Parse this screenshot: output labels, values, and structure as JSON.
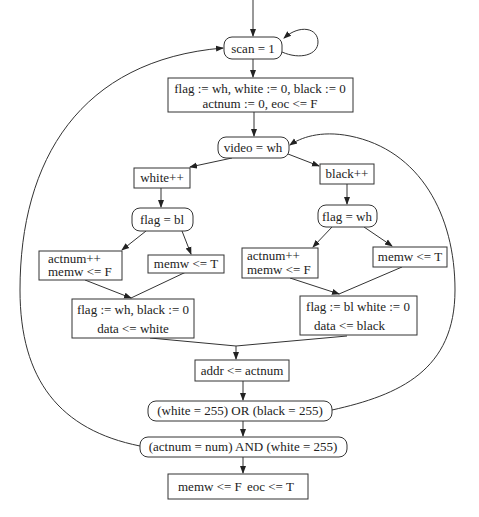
{
  "diagram": {
    "type": "flowchart",
    "nodes": {
      "scan": {
        "label": "scan = 1",
        "shape": "rounded"
      },
      "init": {
        "line1": "flag := wh, white := 0, black := 0",
        "line2": "actnum := 0, eoc <= F",
        "shape": "rect"
      },
      "video": {
        "label": "video = wh",
        "shape": "rounded"
      },
      "white_inc": {
        "label": "white++",
        "shape": "rect"
      },
      "black_inc": {
        "label": "black++",
        "shape": "rect"
      },
      "flag_bl": {
        "label": "flag = bl",
        "shape": "rounded"
      },
      "flag_wh": {
        "label": "flag = wh",
        "shape": "rounded"
      },
      "left_actnum": {
        "line1": "actnum++",
        "line2": "memw <= F",
        "shape": "rect"
      },
      "left_memw": {
        "label": "memw <= T",
        "shape": "rect"
      },
      "right_actnum": {
        "line1": "actnum++",
        "line2": "memw <= F",
        "shape": "rect"
      },
      "right_memw": {
        "label": "memw <= T",
        "shape": "rect"
      },
      "left_assign": {
        "line1": "flag := wh, black := 0",
        "line2": "data <= white",
        "shape": "rect"
      },
      "right_assign": {
        "line1": "flag := bl white := 0",
        "line2": "data <= black",
        "shape": "rect"
      },
      "addr": {
        "label": "addr <= actnum",
        "shape": "rect"
      },
      "or_cond": {
        "label": "(white = 255) OR (black = 255)",
        "shape": "rounded"
      },
      "and_cond": {
        "label": "(actnum = num) AND (white = 255)",
        "shape": "rounded"
      },
      "final": {
        "part1": "memw <= F",
        "part2": "eoc <= T",
        "shape": "rect"
      }
    },
    "edges": [
      {
        "from": "entry",
        "to": "scan"
      },
      {
        "from": "scan",
        "to": "scan",
        "kind": "self-loop"
      },
      {
        "from": "scan",
        "to": "init"
      },
      {
        "from": "init",
        "to": "video"
      },
      {
        "from": "video",
        "to": "white_inc"
      },
      {
        "from": "video",
        "to": "black_inc"
      },
      {
        "from": "white_inc",
        "to": "flag_bl"
      },
      {
        "from": "black_inc",
        "to": "flag_wh"
      },
      {
        "from": "flag_bl",
        "to": "left_actnum"
      },
      {
        "from": "flag_bl",
        "to": "left_memw"
      },
      {
        "from": "flag_wh",
        "to": "right_actnum"
      },
      {
        "from": "flag_wh",
        "to": "right_memw"
      },
      {
        "from": "left_actnum",
        "to": "left_assign"
      },
      {
        "from": "left_memw",
        "to": "left_assign"
      },
      {
        "from": "right_actnum",
        "to": "right_assign"
      },
      {
        "from": "right_memw",
        "to": "right_assign"
      },
      {
        "from": "left_assign",
        "to": "addr"
      },
      {
        "from": "right_assign",
        "to": "addr"
      },
      {
        "from": "addr",
        "to": "or_cond"
      },
      {
        "from": "or_cond",
        "to": "video",
        "kind": "loop-back-right"
      },
      {
        "from": "or_cond",
        "to": "and_cond"
      },
      {
        "from": "and_cond",
        "to": "scan",
        "kind": "loop-back-left"
      },
      {
        "from": "and_cond",
        "to": "final"
      }
    ]
  }
}
